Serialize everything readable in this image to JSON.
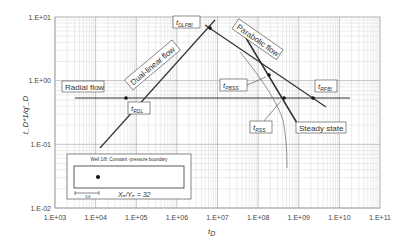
{
  "chart_data": {
    "type": "line",
    "title": "",
    "xlabel": "t_D",
    "ylabel": "t_D * 1/q'_D",
    "xscale": "log",
    "yscale": "log",
    "xlim": [
      1000,
      100000000000
    ],
    "ylim": [
      0.01,
      10
    ],
    "grid": true,
    "x_ticks": [
      "1.E+03",
      "1.E+04",
      "1.E+05",
      "1.E+06",
      "1.E+07",
      "1.E+08",
      "1.E+09",
      "1.E+10",
      "1.E+11"
    ],
    "y_ticks": [
      "1.E-02",
      "1.E-01",
      "1.E+00",
      "1.E+01"
    ],
    "series": [
      {
        "name": "Radial flow",
        "x": [
          15000,
          3000000000
        ],
        "y": [
          0.54,
          0.54
        ]
      },
      {
        "name": "Dual-linear flow",
        "x": [
          13000,
          8000000
        ],
        "y": [
          0.045,
          8.5
        ]
      },
      {
        "name": "Parabolic flow",
        "x": [
          6600000,
          6000000000
        ],
        "y": [
          6.7,
          0.36
        ]
      },
      {
        "name": "Steady state",
        "x": [
          100000000,
          1100000000
        ],
        "y": [
          4.2,
          0.18
        ]
      },
      {
        "name": "Type curve",
        "x": [
          100000000,
          200000000,
          400000000,
          550000000
        ],
        "y": [
          3.5,
          1.5,
          0.45,
          0.1
        ]
      }
    ],
    "annotations": [
      {
        "text": "Radial flow"
      },
      {
        "text": "Dual-linear flow"
      },
      {
        "text": "Parabolic flow"
      },
      {
        "text": "Steady state"
      },
      {
        "text": "t_RDL",
        "x": 56000,
        "y": 0.54
      },
      {
        "text": "t_DLPBI",
        "x": 6600000,
        "y": 6.7
      },
      {
        "text": "t_PBSS",
        "x": 190000000,
        "y": 1.5
      },
      {
        "text": "t_RSS",
        "x": 440000000,
        "y": 0.54
      },
      {
        "text": "t_RPBI",
        "x": 2200000000,
        "y": 0.54
      }
    ],
    "inset": {
      "title": "Well 1/8: Constant -pressure boundary",
      "ratio_label": "X_E/Y_E = 32",
      "scale_label": "1/4"
    }
  },
  "labels": {
    "x_axis": "t",
    "x_axis_sub": "D",
    "y_axis": "t_D*1/q'_D",
    "radial": "Radial flow",
    "dual": "Dual-linear flow",
    "parabolic": "Parabolic flow",
    "steady": "Steady state",
    "t_rdl": "RDL",
    "t_dlpbi": "DLPBI",
    "t_pbss": "PBSS",
    "t_rss": "RSS",
    "t_rpbi": "RPBI",
    "t": "t",
    "inset_title": "Well 1/8: Constant -pressure boundary",
    "inset_ratio": "Xₑ/Yₑ = 32",
    "inset_scale": "1/4"
  }
}
